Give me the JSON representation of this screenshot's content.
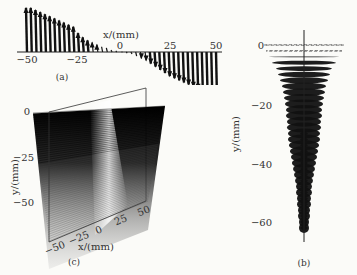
{
  "figure": {
    "panels": [
      {
        "id": "a",
        "label": "(a)",
        "type": "arrow-profile",
        "xaxis": {
          "label": "x/(mm)",
          "ticks": [
            "−50",
            "−25",
            "0",
            "25",
            "50"
          ]
        }
      },
      {
        "id": "b",
        "label": "(b)",
        "type": "vertical-stack",
        "yaxis": {
          "label": "y/(mm)",
          "ticks": [
            "0",
            "−20",
            "−40",
            "−60"
          ]
        }
      },
      {
        "id": "c",
        "label": "(c)",
        "type": "3d-surface",
        "xaxis": {
          "label": "x/(mm)",
          "ticks": [
            "−50",
            "−25",
            "0",
            "25",
            "50"
          ]
        },
        "yaxis": {
          "label": "y/(mm)",
          "ticks": [
            "0",
            "−25",
            "−50"
          ]
        }
      }
    ]
  },
  "chart_data": [
    {
      "type": "bar",
      "title": "(a)",
      "xlabel": "x/(mm)",
      "ylabel": "",
      "xlim": [
        -50,
        50
      ],
      "x": [
        -50,
        -47.5,
        -45,
        -42.5,
        -40,
        -37.5,
        -35,
        -32.5,
        -30,
        -27.5,
        -25,
        -22.5,
        -20,
        -17.5,
        -15,
        -12.5,
        -10,
        -7.5,
        -5,
        -2.5,
        0,
        2.5,
        5,
        7.5,
        10,
        12.5,
        15,
        17.5,
        20,
        22.5,
        25,
        27.5,
        30,
        32.5,
        35,
        37.5,
        40,
        42.5,
        45,
        47.5,
        50
      ],
      "values": [
        42,
        42,
        40,
        38,
        36,
        34,
        32,
        30,
        28,
        26,
        24,
        18,
        14,
        11,
        9,
        7,
        5,
        4,
        2,
        1,
        0,
        -1,
        -2,
        -4,
        -6,
        -8,
        -11,
        -14,
        -17,
        -20,
        -23,
        -25,
        -27,
        -29,
        -31,
        -33,
        -35,
        -37,
        -39,
        -41,
        -43
      ],
      "grid": false
    },
    {
      "type": "bar",
      "title": "(b)",
      "xlabel": "",
      "ylabel": "y/(mm)",
      "ylim": [
        -70,
        5
      ],
      "y": [
        0,
        -2,
        -4,
        -6,
        -8,
        -10,
        -12,
        -14,
        -16,
        -18,
        -20,
        -22,
        -24,
        -26,
        -28,
        -30,
        -32,
        -34,
        -36,
        -38,
        -40,
        -42,
        -44,
        -46,
        -48,
        -50,
        -52,
        -54,
        -56,
        -58,
        -60,
        -62
      ],
      "values": [
        40,
        38,
        35,
        32,
        28,
        26,
        24,
        22,
        21,
        20,
        19,
        18,
        18,
        17,
        17,
        16,
        16,
        15,
        14,
        13,
        12,
        11,
        10,
        9,
        8,
        8,
        7,
        7,
        6,
        6,
        5,
        5
      ],
      "grid": false
    },
    {
      "type": "heatmap",
      "title": "(c)",
      "xlabel": "x/(mm)",
      "ylabel": "y/(mm)",
      "xlim": [
        -50,
        50
      ],
      "ylim": [
        -60,
        0
      ],
      "grid": false
    }
  ]
}
